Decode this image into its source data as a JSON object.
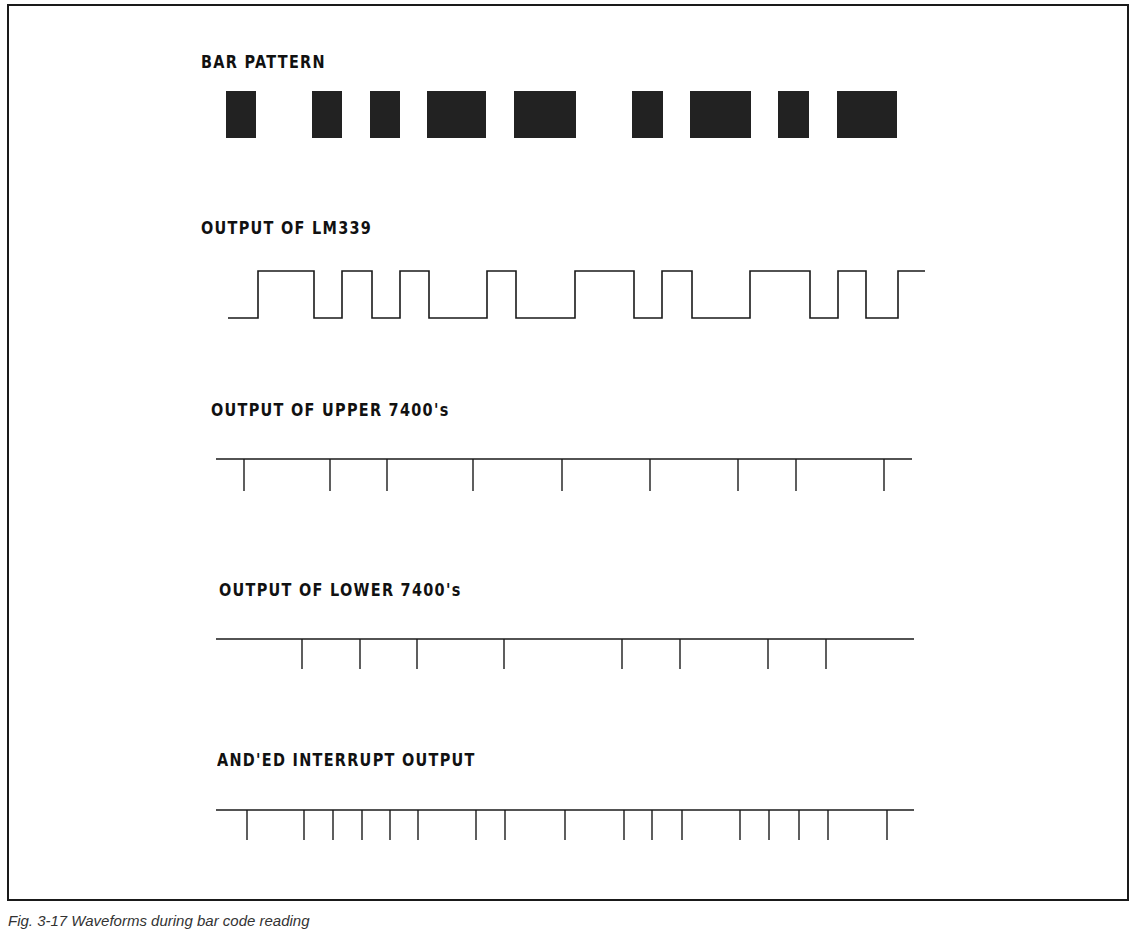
{
  "labels": {
    "bar_pattern": "BAR PATTERN",
    "lm339": "OUTPUT OF LM339",
    "upper": "OUTPUT OF UPPER 7400's",
    "lower": "OUTPUT OF LOWER 7400's",
    "anded": "AND'ED INTERRUPT OUTPUT"
  },
  "caption": "Fig. 3-17 Waveforms during bar code reading",
  "colors": {
    "ink": "#1a1a1a",
    "bar": "#222222",
    "background": "#ffffff"
  },
  "bars": [
    {
      "x1": 226,
      "x2": 256
    },
    {
      "x1": 312,
      "x2": 342
    },
    {
      "x1": 370,
      "x2": 400
    },
    {
      "x1": 427,
      "x2": 486
    },
    {
      "x1": 514,
      "x2": 576
    },
    {
      "x1": 632,
      "x2": 663
    },
    {
      "x1": 690,
      "x2": 751
    },
    {
      "x1": 778,
      "x2": 809
    },
    {
      "x1": 837,
      "x2": 897
    }
  ],
  "bar_y": [
    91,
    138
  ],
  "lm339": {
    "start_x": 228,
    "end_x": 925,
    "high_y": 271,
    "low_y": 318,
    "transitions": [
      258,
      314,
      342,
      372,
      400,
      429,
      487,
      516,
      575,
      634,
      662,
      692,
      750,
      810,
      838,
      866,
      898
    ]
  },
  "upper_pulses": {
    "line": [
      216,
      912
    ],
    "y": 459,
    "depth": 32,
    "x": [
      244,
      330,
      387,
      473,
      562,
      650,
      738,
      796,
      884
    ]
  },
  "lower_pulses": {
    "line": [
      216,
      914
    ],
    "y": 639,
    "depth": 30,
    "x": [
      302,
      360,
      417,
      504,
      622,
      680,
      768,
      826
    ]
  },
  "anded_pulses": {
    "line": [
      216,
      914
    ],
    "y": 810,
    "depth": 30,
    "x": [
      247,
      304,
      333,
      362,
      390,
      418,
      476,
      505,
      565,
      624,
      652,
      682,
      740,
      769,
      799,
      828,
      887
    ]
  }
}
